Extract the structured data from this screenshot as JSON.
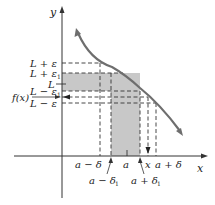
{
  "diagram": {
    "type": "epsilon-delta limit diagram",
    "axes": {
      "x_label": "x",
      "y_label": "y"
    },
    "y_labels": {
      "L_plus_eps": "L + ε",
      "L_plus_eps1": "L + ε",
      "L_plus_eps1_sub": "1",
      "L": "L",
      "L_minus_eps1": "L − ε",
      "L_minus_eps1_sub": "1",
      "fx": "f(x)",
      "L_minus_eps": "L − ε"
    },
    "x_labels": {
      "a_minus_delta": "a − δ",
      "a": "a",
      "x": "x",
      "a_plus_delta": "a + δ",
      "a_minus_delta1": "a − δ",
      "a_minus_delta1_sub": "1",
      "a_plus_delta1": "a + δ",
      "a_plus_delta1_sub": "1"
    },
    "colors": {
      "curve": "#6e6e6e",
      "shade": "#c8c8c8",
      "axis": "#333333",
      "dash": "#333333"
    }
  }
}
